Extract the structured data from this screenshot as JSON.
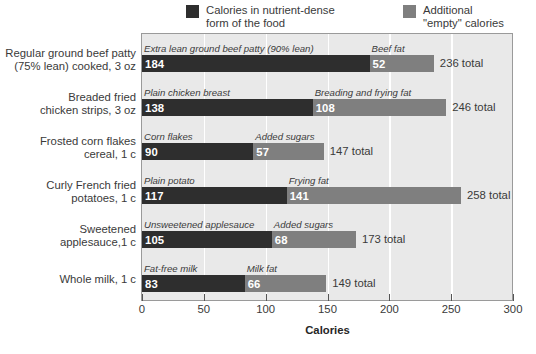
{
  "legend": {
    "position": "top",
    "entries": [
      {
        "label": "Calories in nutrient-dense\nform of the food",
        "color": "#2e2e2e",
        "swatch_name": "legend-swatch-nutrient-dense"
      },
      {
        "label": "Additional\n\"empty\" calories",
        "color": "#7f7f7f",
        "swatch_name": "legend-swatch-empty-calories"
      }
    ]
  },
  "axis": {
    "x_title": "Calories",
    "x_ticks": [
      0,
      50,
      100,
      150,
      200,
      250,
      300
    ],
    "x_tick_labels": [
      "0",
      "50",
      "100",
      "150",
      "200",
      "250",
      "300"
    ],
    "xlim": [
      0,
      300
    ]
  },
  "colors": {
    "bar_dark": "#2e2e2e",
    "bar_gray": "#7f7f7f",
    "plot_background": "#e9e9e9",
    "gridline": "#ffffff",
    "frame": "#9a9a9a",
    "text": "#3a3a3a"
  },
  "chart_data": {
    "type": "bar",
    "orientation": "horizontal",
    "stacked": true,
    "title": "",
    "xlabel": "Calories",
    "ylabel": "",
    "xlim": [
      0,
      300
    ],
    "grid": true,
    "legend_position": "top",
    "categories": [
      "Regular ground beef patty\n(75% lean) cooked, 3 oz",
      "Breaded fried\nchicken strips, 3 oz",
      "Frosted corn flakes\ncereal, 1 c",
      "Curly French fried\npotatoes, 1 c",
      "Sweetened\napplesauce,1 c",
      "Whole milk, 1 c"
    ],
    "series": [
      {
        "name": "Calories in nutrient-dense form of the food",
        "color": "#2e2e2e",
        "values": [
          184,
          138,
          90,
          117,
          105,
          83
        ],
        "point_captions": [
          "Extra lean ground beef patty (90% lean)",
          "Plain chicken breast",
          "Corn flakes",
          "Plain potato",
          "Unsweetened applesauce",
          "Fat-free milk"
        ]
      },
      {
        "name": "Additional \"empty\" calories",
        "color": "#7f7f7f",
        "values": [
          52,
          108,
          57,
          141,
          68,
          66
        ],
        "point_captions": [
          "Beef fat",
          "Breading and frying fat",
          "Added sugars",
          "Frying fat",
          "Added sugars",
          "Milk fat"
        ]
      }
    ],
    "totals": [
      236,
      246,
      147,
      258,
      173,
      149
    ],
    "total_labels": [
      "236 total",
      "246 total",
      "147 total",
      "258 total",
      "173 total",
      "149 total"
    ]
  }
}
